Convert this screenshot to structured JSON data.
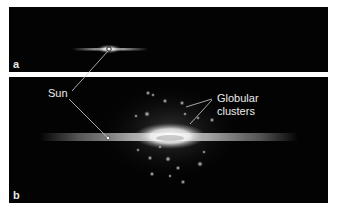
{
  "figure": {
    "panels": [
      {
        "id": "a",
        "label": "a",
        "description": "Edge-on view of the Milky Way disk as traditionally pictured, Sun near center"
      },
      {
        "id": "b",
        "label": "b",
        "description": "Edge-on view with globular clusters distributed around galactic center; Sun offset"
      }
    ],
    "annotations": {
      "sun_label": "Sun",
      "globular_label_line1": "Globular",
      "globular_label_line2": "clusters"
    },
    "colors": {
      "background": "#030303",
      "page": "#ffffff",
      "label_text": "#eaeaea",
      "leader_line": "#cfcfcf"
    }
  }
}
